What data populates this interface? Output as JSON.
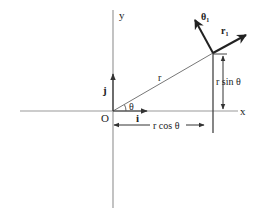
{
  "diagram": {
    "colors": {
      "background": "#ffffff",
      "axis": "#9a9a9a",
      "line": "#333333",
      "text": "#222222"
    },
    "axes": {
      "x_label": "x",
      "y_label": "y",
      "origin_label": "O"
    },
    "unit_vectors": {
      "i_label": "i",
      "j_label": "j",
      "r1_label": "r",
      "r1_subscript": "1",
      "theta1_label": "θ",
      "theta1_subscript": "1"
    },
    "labels": {
      "radius": "r",
      "angle": "θ",
      "r_sin_theta": "r sin θ",
      "r_cos_theta": "r cos θ"
    }
  }
}
